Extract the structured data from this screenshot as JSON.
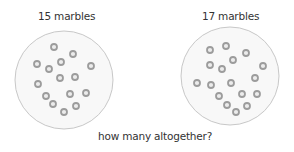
{
  "groups": [
    {
      "label": "15 marbles",
      "count": 15,
      "circle": {
        "cx": 64,
        "cy": 80,
        "r": 49
      },
      "marbles": [
        [
          54,
          47
        ],
        [
          73,
          54
        ],
        [
          37,
          64
        ],
        [
          61,
          62
        ],
        [
          91,
          66
        ],
        [
          49,
          69
        ],
        [
          38,
          84
        ],
        [
          60,
          78
        ],
        [
          75,
          77
        ],
        [
          46,
          96
        ],
        [
          70,
          94
        ],
        [
          86,
          93
        ],
        [
          53,
          104
        ],
        [
          76,
          106
        ],
        [
          64,
          112
        ]
      ]
    },
    {
      "label": "17 marbles",
      "count": 17,
      "circle": {
        "cx": 230,
        "cy": 76,
        "r": 49
      },
      "marbles": [
        [
          210,
          50
        ],
        [
          226,
          46
        ],
        [
          246,
          53
        ],
        [
          210,
          65
        ],
        [
          233,
          60
        ],
        [
          222,
          69
        ],
        [
          263,
          66
        ],
        [
          197,
          83
        ],
        [
          211,
          85
        ],
        [
          231,
          83
        ],
        [
          255,
          78
        ],
        [
          219,
          96
        ],
        [
          242,
          94
        ],
        [
          257,
          94
        ],
        [
          227,
          105
        ],
        [
          247,
          106
        ],
        [
          236,
          112
        ]
      ]
    }
  ],
  "question": "how many altogether?",
  "colors": {
    "circle_fill": "#f8f8f8",
    "circle_stroke": "#c8c8c8",
    "marble_ring": "#9c9c9c",
    "marble_center": "#ececec",
    "text": "#333333"
  }
}
